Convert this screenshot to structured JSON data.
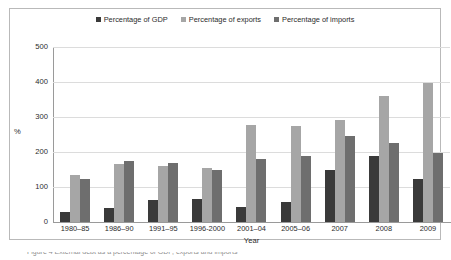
{
  "chart_data": {
    "type": "bar",
    "title": "",
    "xlabel": "Year",
    "ylabel": "%",
    "ylim": [
      0,
      500
    ],
    "yticks": [
      0,
      100,
      200,
      300,
      400,
      500
    ],
    "grid": true,
    "legend_position": "top-center",
    "categories": [
      "1980–85",
      "1986–90",
      "1991–95",
      "1996-2000",
      "2001–04",
      "2005–06",
      "2007",
      "2008",
      "2009"
    ],
    "series": [
      {
        "name": "Percentage of GDP",
        "color": "#3a3a3a",
        "values": [
          28,
          40,
          62,
          66,
          44,
          57,
          150,
          188,
          122
        ]
      },
      {
        "name": "Percentage of exports",
        "color": "#a6a6a6",
        "values": [
          133,
          166,
          160,
          155,
          276,
          274,
          291,
          360,
          397
        ]
      },
      {
        "name": "Percentage of imports",
        "color": "#6e6e6e",
        "values": [
          122,
          175,
          169,
          150,
          181,
          189,
          246,
          225,
          196
        ]
      }
    ]
  },
  "legend": {
    "items": [
      {
        "label": "Percentage of GDP",
        "color": "#3a3a3a",
        "name": "legend-item-gdp"
      },
      {
        "label": "Percentage of exports",
        "color": "#a6a6a6",
        "name": "legend-item-exports"
      },
      {
        "label": "Percentage of imports",
        "color": "#6e6e6e",
        "name": "legend-item-imports"
      }
    ]
  },
  "axes": {
    "y_title": "%",
    "x_title": "Year",
    "y_tick_labels": [
      "500",
      "400",
      "300",
      "200",
      "100",
      "0"
    ]
  },
  "caption": {
    "sliver_text": "Figure 4 External debt as a percentage of GDP, exports and imports"
  }
}
